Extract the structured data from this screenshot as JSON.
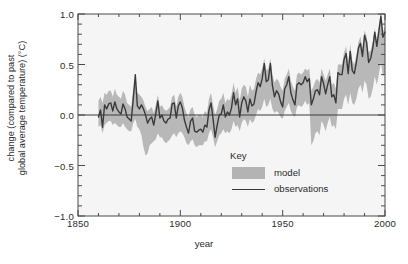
{
  "chart_data": {
    "type": "line",
    "title": "",
    "subtitle": "",
    "xlabel": "year",
    "ylabel": "change (compared to past global average temperature) (°C)",
    "ylabel_line1": "change (compared to past",
    "ylabel_line2": "global average temperature) (°C)",
    "xlim": [
      1850,
      2000
    ],
    "ylim": [
      -1.0,
      1.0
    ],
    "xticks": [
      1850,
      1900,
      1950,
      2000
    ],
    "xtick_labels": [
      "1850",
      "1900",
      "1950",
      "2000"
    ],
    "yticks": [
      -1.0,
      -0.5,
      0.0,
      0.5,
      1.0
    ],
    "ytick_labels": [
      "−1.0",
      "−0.5",
      "0.0",
      "0.5",
      "1.0"
    ],
    "minor_tick_interval": 0.1,
    "grid": false,
    "zero_line": true,
    "legend": {
      "title": "Key",
      "position": "inside-center-bottom",
      "entries": [
        {
          "name": "model",
          "type": "band",
          "color": "#b3b3b3"
        },
        {
          "name": "observations",
          "type": "line",
          "color": "#3a3a3a"
        }
      ]
    },
    "colors": {
      "background": "#f5f5f5",
      "frame": "#4a4a4a",
      "observations_line": "#3a3a3a",
      "model_band": "#b8b8b8",
      "text": "#2b2b2b"
    },
    "x": [
      1860,
      1861,
      1862,
      1863,
      1864,
      1865,
      1866,
      1867,
      1868,
      1869,
      1870,
      1871,
      1872,
      1873,
      1874,
      1875,
      1876,
      1877,
      1878,
      1879,
      1880,
      1881,
      1882,
      1883,
      1884,
      1885,
      1886,
      1887,
      1888,
      1889,
      1890,
      1891,
      1892,
      1893,
      1894,
      1895,
      1896,
      1897,
      1898,
      1899,
      1900,
      1901,
      1902,
      1903,
      1904,
      1905,
      1906,
      1907,
      1908,
      1909,
      1910,
      1911,
      1912,
      1913,
      1914,
      1915,
      1916,
      1917,
      1918,
      1919,
      1920,
      1921,
      1922,
      1923,
      1924,
      1925,
      1926,
      1927,
      1928,
      1929,
      1930,
      1931,
      1932,
      1933,
      1934,
      1935,
      1936,
      1937,
      1938,
      1939,
      1940,
      1941,
      1942,
      1943,
      1944,
      1945,
      1946,
      1947,
      1948,
      1949,
      1950,
      1951,
      1952,
      1953,
      1954,
      1955,
      1956,
      1957,
      1958,
      1959,
      1960,
      1961,
      1962,
      1963,
      1964,
      1965,
      1966,
      1967,
      1968,
      1969,
      1970,
      1971,
      1972,
      1973,
      1974,
      1975,
      1976,
      1977,
      1978,
      1979,
      1980,
      1981,
      1982,
      1983,
      1984,
      1985,
      1986,
      1987,
      1988,
      1989,
      1990,
      1991,
      1992,
      1993,
      1994,
      1995,
      1996,
      1997,
      1998,
      1999,
      2000
    ],
    "series": [
      {
        "name": "observations",
        "type": "line",
        "color": "#3a3a3a",
        "values": [
          -0.02,
          0.05,
          -0.12,
          0.1,
          0.06,
          0.11,
          0.12,
          0.04,
          0.13,
          0.06,
          0.03,
          0.01,
          0.11,
          0.06,
          -0.02,
          -0.04,
          -0.06,
          0.16,
          0.4,
          0.09,
          0.06,
          0.1,
          0.06,
          0.0,
          -0.08,
          -0.04,
          -0.02,
          -0.1,
          0.01,
          0.14,
          -0.03,
          0.0,
          -0.06,
          -0.08,
          -0.04,
          -0.03,
          0.11,
          0.12,
          -0.03,
          0.09,
          0.13,
          0.07,
          -0.05,
          -0.12,
          -0.18,
          -0.06,
          -0.03,
          -0.16,
          -0.17,
          -0.15,
          -0.14,
          -0.17,
          -0.1,
          -0.12,
          0.05,
          0.12,
          -0.04,
          -0.22,
          -0.1,
          0.0,
          0.01,
          0.1,
          -0.02,
          0.03,
          0.0,
          0.07,
          0.22,
          0.1,
          0.16,
          -0.02,
          0.12,
          0.18,
          0.14,
          0.03,
          0.16,
          0.09,
          0.11,
          0.23,
          0.32,
          0.28,
          0.36,
          0.51,
          0.33,
          0.35,
          0.51,
          0.29,
          0.18,
          0.24,
          0.21,
          0.13,
          0.08,
          0.26,
          0.3,
          0.38,
          0.22,
          0.15,
          0.1,
          0.3,
          0.32,
          0.3,
          0.32,
          0.38,
          0.33,
          0.36,
          0.1,
          0.16,
          0.24,
          0.25,
          0.2,
          0.38,
          0.31,
          0.21,
          0.3,
          0.38,
          0.18,
          0.2,
          0.12,
          0.42,
          0.4,
          0.4,
          0.55,
          0.61,
          0.41,
          0.63,
          0.44,
          0.41,
          0.52,
          0.66,
          0.71,
          0.58,
          0.79,
          0.72,
          0.52,
          0.56,
          0.66,
          0.82,
          0.68,
          0.83,
          0.98,
          0.77,
          0.82
        ]
      },
      {
        "name": "model",
        "type": "band",
        "color": "#b8b8b8",
        "lower": [
          -0.12,
          -0.1,
          -0.18,
          -0.1,
          -0.08,
          -0.06,
          -0.06,
          -0.1,
          -0.08,
          -0.1,
          -0.12,
          -0.12,
          -0.08,
          -0.12,
          -0.14,
          -0.16,
          -0.16,
          -0.08,
          -0.04,
          -0.12,
          -0.14,
          -0.2,
          -0.32,
          -0.4,
          -0.38,
          -0.3,
          -0.28,
          -0.26,
          -0.24,
          -0.18,
          -0.22,
          -0.22,
          -0.26,
          -0.28,
          -0.26,
          -0.24,
          -0.2,
          -0.18,
          -0.22,
          -0.18,
          -0.16,
          -0.18,
          -0.22,
          -0.28,
          -0.3,
          -0.26,
          -0.24,
          -0.3,
          -0.32,
          -0.3,
          -0.3,
          -0.3,
          -0.26,
          -0.26,
          -0.18,
          -0.14,
          -0.22,
          -0.32,
          -0.26,
          -0.2,
          -0.18,
          -0.14,
          -0.18,
          -0.16,
          -0.18,
          -0.14,
          -0.06,
          -0.12,
          -0.1,
          -0.16,
          -0.08,
          -0.04,
          -0.06,
          -0.12,
          -0.04,
          -0.08,
          -0.06,
          0.0,
          0.06,
          0.04,
          0.08,
          0.16,
          0.08,
          0.1,
          0.16,
          0.06,
          0.02,
          0.04,
          0.02,
          -0.02,
          -0.04,
          0.04,
          0.08,
          0.12,
          0.04,
          0.0,
          -0.02,
          0.08,
          0.1,
          0.08,
          0.1,
          0.14,
          0.1,
          0.12,
          -0.3,
          -0.26,
          -0.18,
          -0.16,
          -0.2,
          -0.06,
          -0.1,
          -0.16,
          -0.08,
          -0.02,
          -0.12,
          -0.1,
          -0.14,
          0.06,
          0.06,
          0.06,
          0.16,
          0.2,
          0.1,
          0.22,
          0.12,
          0.1,
          0.16,
          0.26,
          0.3,
          0.22,
          0.34,
          0.3,
          0.16,
          0.18,
          0.26,
          0.38,
          0.3,
          0.4,
          0.52,
          0.38,
          0.42
        ],
        "upper": [
          0.14,
          0.18,
          0.12,
          0.22,
          0.2,
          0.24,
          0.24,
          0.18,
          0.26,
          0.2,
          0.18,
          0.16,
          0.24,
          0.2,
          0.12,
          0.1,
          0.08,
          0.26,
          0.32,
          0.22,
          0.2,
          0.18,
          0.14,
          0.08,
          0.04,
          0.06,
          0.08,
          0.02,
          0.1,
          0.2,
          0.08,
          0.1,
          0.06,
          0.04,
          0.06,
          0.08,
          0.18,
          0.2,
          0.08,
          0.18,
          0.22,
          0.18,
          0.08,
          0.02,
          -0.02,
          0.06,
          0.08,
          0.0,
          -0.02,
          0.0,
          0.0,
          -0.02,
          0.04,
          0.02,
          0.16,
          0.22,
          0.1,
          0.0,
          0.06,
          0.14,
          0.16,
          0.22,
          0.12,
          0.16,
          0.14,
          0.2,
          0.32,
          0.22,
          0.28,
          0.14,
          0.26,
          0.3,
          0.28,
          0.18,
          0.3,
          0.24,
          0.26,
          0.36,
          0.42,
          0.4,
          0.46,
          0.56,
          0.44,
          0.46,
          0.56,
          0.4,
          0.32,
          0.36,
          0.34,
          0.28,
          0.24,
          0.36,
          0.4,
          0.46,
          0.34,
          0.28,
          0.24,
          0.4,
          0.42,
          0.4,
          0.42,
          0.46,
          0.44,
          0.46,
          0.24,
          0.28,
          0.34,
          0.36,
          0.32,
          0.46,
          0.4,
          0.34,
          0.4,
          0.46,
          0.3,
          0.32,
          0.26,
          0.5,
          0.5,
          0.5,
          0.62,
          0.68,
          0.5,
          0.7,
          0.54,
          0.5,
          0.6,
          0.72,
          0.78,
          0.66,
          0.84,
          0.78,
          0.62,
          0.64,
          0.72,
          0.86,
          0.74,
          0.88,
          1.0,
          0.82,
          0.88
        ]
      }
    ]
  }
}
